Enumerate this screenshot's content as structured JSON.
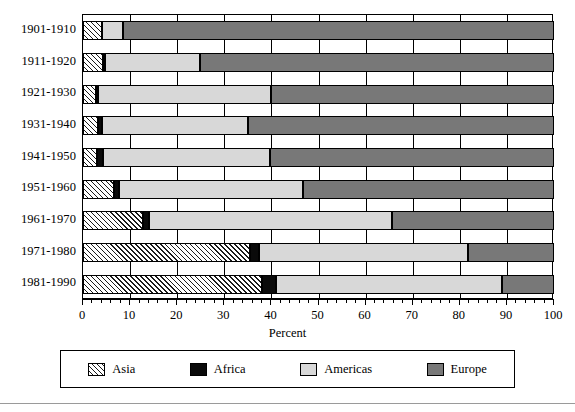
{
  "chart_data": {
    "type": "bar",
    "orientation": "horizontal",
    "stacked": true,
    "title": "",
    "xlabel": "Percent",
    "ylabel": "",
    "xlim": [
      0,
      100
    ],
    "xticks": [
      0,
      10,
      20,
      30,
      40,
      50,
      60,
      70,
      80,
      90,
      100
    ],
    "xticklabels": [
      "0",
      "10",
      "20",
      "30",
      "40",
      "50",
      "60",
      "70",
      "80",
      "90",
      "100"
    ],
    "minor_tick_interval": 2,
    "grid": true,
    "grid_axis": "x",
    "legend_position": "below",
    "categories": [
      "1901-1910",
      "1911-1920",
      "1921-1930",
      "1931-1940",
      "1941-1950",
      "1951-1960",
      "1961-1970",
      "1971-1980",
      "1981-1990"
    ],
    "series": [
      {
        "name": "Asia",
        "fill": "hatched-diagonal",
        "color": "#ffffff",
        "values": [
          4.0,
          4.3,
          2.8,
          3.2,
          3.0,
          6.6,
          12.8,
          35.4,
          38.0
        ]
      },
      {
        "name": "Africa",
        "fill": "solid",
        "color": "#0a0a0a",
        "values": [
          0.0,
          0.4,
          0.4,
          0.9,
          1.2,
          1.1,
          1.3,
          2.0,
          2.9
        ]
      },
      {
        "name": "Americas",
        "fill": "solid",
        "color": "#d8d8d8",
        "values": [
          4.5,
          20.2,
          36.8,
          30.9,
          35.6,
          39.1,
          51.6,
          44.3,
          48.1
        ]
      },
      {
        "name": "Europe",
        "fill": "solid",
        "color": "#787878",
        "values": [
          91.5,
          75.1,
          60.0,
          65.0,
          60.2,
          53.2,
          34.3,
          18.3,
          11.0
        ]
      }
    ]
  },
  "legend": {
    "entries": [
      {
        "label": "Asia"
      },
      {
        "label": "Africa"
      },
      {
        "label": "Americas"
      },
      {
        "label": "Europe"
      }
    ]
  }
}
